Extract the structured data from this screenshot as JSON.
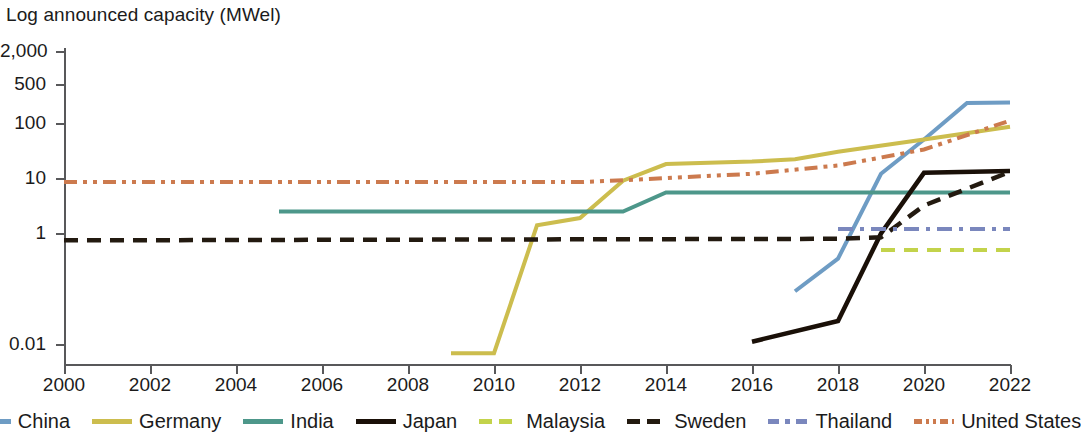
{
  "chart_data": {
    "type": "line",
    "title": "Log announced capacity (MWel)",
    "xlabel": "",
    "ylabel": "Log announced capacity (MWel)",
    "y_scale": "log",
    "ylim": [
      0.005,
      2000
    ],
    "xlim": [
      2000,
      2022
    ],
    "y_ticks": [
      {
        "value": 2000,
        "label": "2,000"
      },
      {
        "value": 500,
        "label": "500"
      },
      {
        "value": 100,
        "label": "100"
      },
      {
        "value": 10,
        "label": "10"
      },
      {
        "value": 1,
        "label": "1"
      },
      {
        "value": 0.01,
        "label": "0.01"
      }
    ],
    "x_ticks": [
      {
        "value": 2000,
        "label": "2000"
      },
      {
        "value": 2002,
        "label": "2002"
      },
      {
        "value": 2004,
        "label": "2004"
      },
      {
        "value": 2006,
        "label": "2006"
      },
      {
        "value": 2008,
        "label": "2008"
      },
      {
        "value": 2010,
        "label": "2010"
      },
      {
        "value": 2012,
        "label": "2012"
      },
      {
        "value": 2014,
        "label": "2014"
      },
      {
        "value": 2016,
        "label": "2016"
      },
      {
        "value": 2018,
        "label": "2018"
      },
      {
        "value": 2020,
        "label": "2020"
      },
      {
        "value": 2022,
        "label": "2022"
      }
    ],
    "grid": false,
    "legend_position": "bottom",
    "series": [
      {
        "name": "China",
        "color": "#6e9cc4",
        "style": "solid",
        "width": 4,
        "x": [
          2017,
          2018,
          2019,
          2020,
          2021,
          2022
        ],
        "values": [
          0.09,
          0.35,
          12,
          50,
          230,
          235
        ]
      },
      {
        "name": "Germany",
        "color": "#ccbd4e",
        "style": "solid",
        "width": 4,
        "x": [
          2009,
          2010,
          2011,
          2012,
          2013,
          2014,
          2016,
          2017,
          2018,
          2020,
          2022
        ],
        "values": [
          0.0068,
          0.0068,
          1.4,
          1.9,
          9.0,
          18,
          20,
          22,
          30,
          50,
          85
        ]
      },
      {
        "name": "India",
        "color": "#4d978a",
        "style": "solid",
        "width": 4,
        "x": [
          2005,
          2013,
          2014,
          2022
        ],
        "values": [
          2.5,
          2.5,
          5.5,
          5.5
        ]
      },
      {
        "name": "Japan",
        "color": "#1a1008",
        "style": "solid",
        "width": 4.5,
        "x": [
          2016,
          2018,
          2019,
          2020,
          2022
        ],
        "values": [
          0.011,
          0.026,
          1.0,
          12.5,
          13.5
        ]
      },
      {
        "name": "Malaysia",
        "color": "#c3d34b",
        "style": "dashed",
        "width": 4,
        "x": [
          2019,
          2022
        ],
        "values": [
          0.5,
          0.5
        ]
      },
      {
        "name": "Sweden",
        "color": "#231a10",
        "style": "dashed",
        "width": 4.5,
        "x": [
          2000,
          2018,
          2019,
          2020,
          2022
        ],
        "values": [
          0.75,
          0.8,
          0.85,
          3.2,
          13.0
        ]
      },
      {
        "name": "Thailand",
        "color": "#7a87bd",
        "style": "dash-dot",
        "width": 4,
        "x": [
          2018,
          2022
        ],
        "values": [
          1.2,
          1.2
        ]
      },
      {
        "name": "United States",
        "color": "#cc7a4e",
        "style": "dash-dot-dot",
        "width": 4,
        "x": [
          2000,
          2012,
          2013,
          2016,
          2018,
          2020,
          2022
        ],
        "values": [
          8.5,
          8.5,
          9.2,
          12,
          17,
          33,
          110
        ]
      }
    ]
  },
  "legend": {
    "items": [
      {
        "label": "China"
      },
      {
        "label": "Germany"
      },
      {
        "label": "India"
      },
      {
        "label": "Japan"
      },
      {
        "label": "Malaysia"
      },
      {
        "label": "Sweden"
      },
      {
        "label": "Thailand"
      },
      {
        "label": "United States"
      }
    ]
  }
}
